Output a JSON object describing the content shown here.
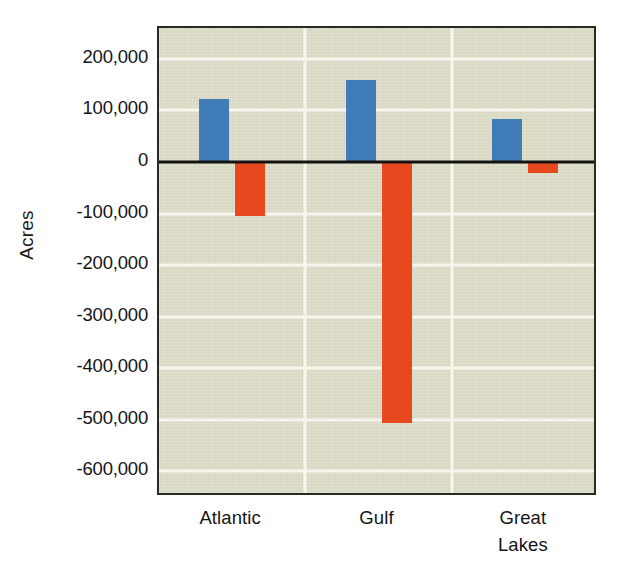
{
  "chart_data": {
    "type": "bar",
    "title": "",
    "xlabel": "",
    "ylabel": "Acres",
    "categories": [
      "Atlantic",
      "Gulf",
      "Great\nLakes"
    ],
    "series": [
      {
        "name": "gains",
        "color": "#3f7cb8",
        "values": [
          123000,
          160000,
          83000
        ]
      },
      {
        "name": "losses",
        "color": "#e8481e",
        "values": [
          -105000,
          -506000,
          -21000
        ]
      }
    ],
    "ylim": [
      -650000,
      260000
    ],
    "yticks": [
      200000,
      100000,
      0,
      -100000,
      -200000,
      -300000,
      -400000,
      -500000,
      -600000
    ],
    "ytick_labels": [
      "200,000",
      "100,000",
      "0",
      "-100,000",
      "-200,000",
      "-300,000",
      "-400,000",
      "-500,000",
      "-600,000"
    ],
    "grid": true,
    "grid_color": "#f6f6ee",
    "vertical_gridlines": true,
    "legend": "none",
    "plot_background": "#dbdbc6",
    "axis_border_color": "#2a2a25",
    "zero_line_color": "#131311"
  }
}
